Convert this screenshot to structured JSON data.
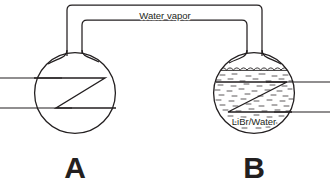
{
  "diagram": {
    "background_color": "#ffffff",
    "line_color": "#231f20",
    "width": 330,
    "height": 186,
    "connector": {
      "label": "Water vapor",
      "name": "vapor-tube",
      "outer_top_y": 5,
      "inner_top_y": 20,
      "left_outer_x": 67,
      "left_inner_x": 82,
      "right_inner_x": 247,
      "right_outer_x": 262
    },
    "flasks": [
      {
        "id": "A",
        "name": "flask-a",
        "label": "A",
        "label_x": 75,
        "label_y": 178,
        "center_x": 75,
        "center_y": 93,
        "radius": 41,
        "contents": "",
        "has_liquid": false,
        "coil": {
          "name": "heat-exchanger-coil-a",
          "points": "34,78 105,78 56,108 116,108"
        },
        "pipes": [
          {
            "name": "pipe-inlet-upper-a",
            "x1": 0,
            "y1": 78,
            "x2": 60,
            "y2": 78
          },
          {
            "name": "pipe-outlet-lower-a",
            "x1": 0,
            "y1": 108,
            "x2": 70,
            "y2": 108
          }
        ]
      },
      {
        "id": "B",
        "name": "flask-b",
        "label": "B",
        "label_x": 254,
        "label_y": 178,
        "center_x": 254,
        "center_y": 93,
        "radius": 41,
        "contents": "LiBr/Water",
        "contents_x": 254,
        "contents_y": 121,
        "has_liquid": true,
        "liquid_surface_y": 70,
        "coil": {
          "name": "heat-exchanger-coil-b",
          "points": "216,82 287,82 228,112 292,112"
        },
        "pipes": [
          {
            "name": "pipe-inlet-upper-b",
            "x1": 268,
            "y1": 82,
            "x2": 330,
            "y2": 82
          },
          {
            "name": "pipe-outlet-lower-b",
            "x1": 276,
            "y1": 112,
            "x2": 330,
            "y2": 112
          }
        ]
      }
    ]
  }
}
